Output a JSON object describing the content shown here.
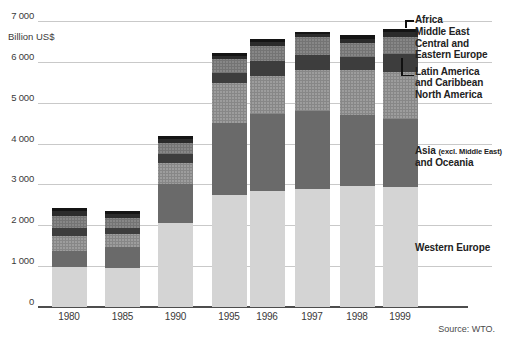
{
  "chart_data": {
    "type": "bar",
    "stacked": true,
    "title": "",
    "ylabel": "Billion US$",
    "ylim": [
      0,
      7000
    ],
    "ytick_labels": [
      "0",
      "1 000",
      "2 000",
      "3 000",
      "4 000",
      "5 000",
      "6 000",
      "7 000"
    ],
    "grid": true,
    "categories": [
      "1980",
      "1985",
      "1990",
      "1995",
      "1996",
      "1997",
      "1998",
      "1999"
    ],
    "series": [
      {
        "name": "Western Europe",
        "color": "#d4d4d4",
        "dotted": false,
        "values": [
          975,
          965,
          2055,
          2750,
          2835,
          2895,
          2960,
          2935
        ]
      },
      {
        "name": "Asia (excl. Middle East) and Oceania",
        "color": "#6a6a6a",
        "dotted": false,
        "values": [
          405,
          500,
          945,
          1765,
          1895,
          1910,
          1750,
          1675
        ]
      },
      {
        "name": "North America",
        "color": "#9d9d9d",
        "dotted": true,
        "values": [
          365,
          310,
          530,
          975,
          920,
          1000,
          1090,
          1145
        ]
      },
      {
        "name": "Latin America and Caribbean",
        "color": "#3d3d3d",
        "dotted": false,
        "values": [
          180,
          160,
          220,
          245,
          365,
          365,
          325,
          445
        ]
      },
      {
        "name": "Central and Eastern Europe",
        "color": "#878787",
        "dotted": true,
        "values": [
          310,
          245,
          270,
          325,
          380,
          430,
          325,
          405
        ]
      },
      {
        "name": "Middle East",
        "color": "#2b2b2b",
        "dotted": false,
        "values": [
          110,
          100,
          100,
          95,
          100,
          85,
          120,
          120
        ]
      },
      {
        "name": "Africa",
        "color": "#141414",
        "dotted": false,
        "values": [
          70,
          65,
          60,
          65,
          65,
          55,
          85,
          80
        ]
      }
    ],
    "totals": [
      2415,
      2345,
      4180,
      6220,
      6560,
      6740,
      6655,
      6805
    ],
    "legend_position": "right"
  },
  "legend": {
    "africa": "Africa",
    "middle_east": "Middle East",
    "cee_line1": "Central and",
    "cee_line2": "Eastern Europe",
    "la_line1": "Latin America",
    "la_line2": "and Caribbean",
    "north_america": "North America",
    "asia_main": "Asia",
    "asia_paren": "(excl. Middle East)",
    "asia_line2": "and Oceania",
    "western_europe": "Western Europe"
  },
  "source": "Source: WTO."
}
